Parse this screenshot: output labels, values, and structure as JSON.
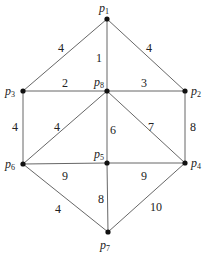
{
  "graph": {
    "nodes": [
      {
        "id": "p1",
        "label": "p",
        "sub": "1",
        "x": 107,
        "y": 19,
        "lx": 99,
        "ly": 12
      },
      {
        "id": "p2",
        "label": "p",
        "sub": "2",
        "x": 185,
        "y": 91,
        "lx": 191,
        "ly": 95
      },
      {
        "id": "p3",
        "label": "p",
        "sub": "3",
        "x": 23,
        "y": 91,
        "lx": 5,
        "ly": 95
      },
      {
        "id": "p4",
        "label": "p",
        "sub": "4",
        "x": 185,
        "y": 163,
        "lx": 191,
        "ly": 167
      },
      {
        "id": "p5",
        "label": "p",
        "sub": "5",
        "x": 107,
        "y": 163,
        "lx": 94,
        "ly": 158
      },
      {
        "id": "p6",
        "label": "p",
        "sub": "6",
        "x": 23,
        "y": 164,
        "lx": 5,
        "ly": 168
      },
      {
        "id": "p7",
        "label": "p",
        "sub": "7",
        "x": 108,
        "y": 232,
        "lx": 100,
        "ly": 249
      },
      {
        "id": "p8",
        "label": "p",
        "sub": "8",
        "x": 107,
        "y": 91,
        "lx": 94,
        "ly": 86
      }
    ],
    "edges": [
      {
        "from": "p1",
        "to": "p3",
        "weight": "4",
        "lx": 58,
        "ly": 52
      },
      {
        "from": "p1",
        "to": "p2",
        "weight": "4",
        "lx": 146,
        "ly": 52
      },
      {
        "from": "p1",
        "to": "p8",
        "weight": "1",
        "lx": 96,
        "ly": 62
      },
      {
        "from": "p3",
        "to": "p8",
        "weight": "2",
        "lx": 62,
        "ly": 87
      },
      {
        "from": "p8",
        "to": "p2",
        "weight": "3",
        "lx": 141,
        "ly": 87
      },
      {
        "from": "p3",
        "to": "p6",
        "weight": "4",
        "lx": 12,
        "ly": 131
      },
      {
        "from": "p8",
        "to": "p6",
        "weight": "4",
        "lx": 54,
        "ly": 131
      },
      {
        "from": "p8",
        "to": "p5",
        "weight": "6",
        "lx": 110,
        "ly": 134
      },
      {
        "from": "p8",
        "to": "p4",
        "weight": "7",
        "lx": 148,
        "ly": 131
      },
      {
        "from": "p2",
        "to": "p4",
        "weight": "8",
        "lx": 190,
        "ly": 131
      },
      {
        "from": "p6",
        "to": "p5",
        "weight": "9",
        "lx": 62,
        "ly": 180
      },
      {
        "from": "p5",
        "to": "p4",
        "weight": "9",
        "lx": 141,
        "ly": 180
      },
      {
        "from": "p6",
        "to": "p7",
        "weight": "4",
        "lx": 55,
        "ly": 213
      },
      {
        "from": "p5",
        "to": "p7",
        "weight": "8",
        "lx": 98,
        "ly": 203
      },
      {
        "from": "p4",
        "to": "p7",
        "weight": "10",
        "lx": 150,
        "ly": 211
      }
    ]
  }
}
